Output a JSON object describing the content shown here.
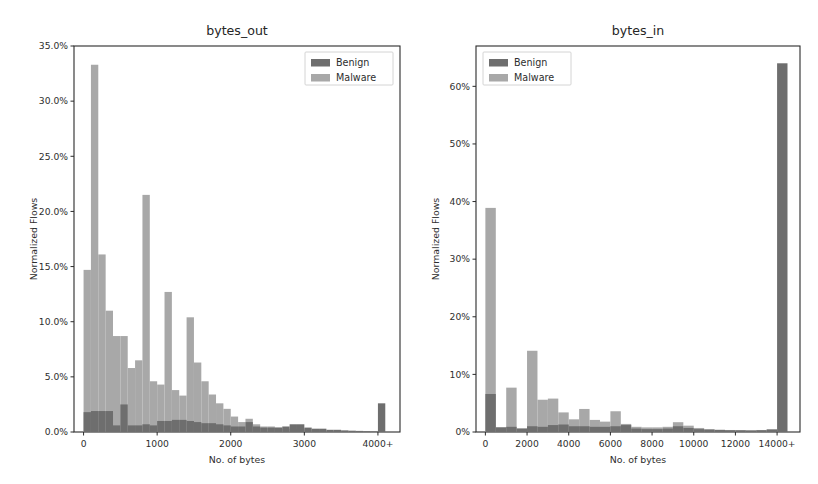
{
  "figure": {
    "background": "#ffffff",
    "width": 818,
    "height": 484
  },
  "colors": {
    "benign": "#6e6e6e",
    "malware": "#a8a8a8",
    "axis": "#2b2b2b",
    "text": "#2e2e2e"
  },
  "legend": {
    "benign_label": "Benign",
    "malware_label": "Malware"
  },
  "chart_data": [
    {
      "type": "bar",
      "id": "bytes_out",
      "title": "bytes_out",
      "xlabel": "No. of bytes",
      "ylabel": "Normalized Flows",
      "grid": false,
      "legend_position": "upper right",
      "xlim": [
        -130,
        4300
      ],
      "ylim": [
        0,
        35
      ],
      "xticks": [
        0,
        1000,
        2000,
        3000,
        4000
      ],
      "xticklabels": [
        "0",
        "1000",
        "2000",
        "3000",
        "4000+"
      ],
      "yticks": [
        0,
        5,
        10,
        15,
        20,
        25,
        30,
        35
      ],
      "yticklabels": [
        "0.0%",
        "5.0%",
        "10.0%",
        "15.0%",
        "20.0%",
        "25.0%",
        "30.0%",
        "35.0%"
      ],
      "bin_width": 100,
      "bin_starts": [
        0,
        100,
        200,
        300,
        400,
        500,
        600,
        700,
        800,
        900,
        1000,
        1100,
        1200,
        1300,
        1400,
        1500,
        1600,
        1700,
        1800,
        1900,
        2000,
        2100,
        2200,
        2300,
        2400,
        2500,
        2600,
        2700,
        2800,
        2900,
        3000,
        3100,
        3200,
        3300,
        3400,
        3500,
        3600,
        3700,
        3800,
        3900,
        4000
      ],
      "series": [
        {
          "name": "Malware",
          "color": "#a8a8a8",
          "values": [
            14.7,
            33.3,
            16.1,
            11.0,
            8.7,
            8.7,
            5.8,
            6.5,
            21.5,
            4.6,
            4.3,
            12.7,
            3.8,
            3.3,
            10.4,
            6.3,
            4.6,
            3.4,
            2.6,
            2.1,
            1.4,
            0.9,
            1.2,
            0.7,
            0.5,
            0.5,
            0.4,
            0.3,
            0.3,
            0.3,
            0.2,
            0.2,
            0.15,
            0.1,
            0.1,
            0.08,
            0.06,
            0.05,
            0.04,
            0.03,
            0.0
          ]
        },
        {
          "name": "Benign",
          "color": "#6e6e6e",
          "values": [
            1.8,
            1.9,
            1.9,
            1.9,
            0.6,
            2.5,
            0.6,
            0.6,
            0.7,
            0.6,
            1.0,
            1.0,
            1.1,
            1.1,
            1.0,
            0.9,
            0.8,
            0.8,
            0.7,
            0.6,
            0.5,
            0.5,
            0.9,
            0.5,
            0.4,
            0.4,
            0.4,
            0.5,
            0.7,
            0.7,
            0.4,
            0.3,
            0.3,
            0.2,
            0.2,
            0.15,
            0.12,
            0.1,
            0.08,
            0.06,
            2.6
          ]
        }
      ]
    },
    {
      "type": "bar",
      "id": "bytes_in",
      "title": "bytes_in",
      "xlabel": "No. of bytes",
      "ylabel": "Normalized Flows",
      "grid": false,
      "legend_position": "upper left",
      "xlim": [
        -450,
        15100
      ],
      "ylim": [
        0,
        67
      ],
      "xticks": [
        0,
        2000,
        4000,
        6000,
        8000,
        10000,
        12000,
        14000
      ],
      "xticklabels": [
        "0",
        "2000",
        "4000",
        "6000",
        "8000",
        "10000",
        "12000",
        "14000+"
      ],
      "yticks": [
        0,
        10,
        20,
        30,
        40,
        50,
        60
      ],
      "yticklabels": [
        "0%",
        "10%",
        "20%",
        "30%",
        "40%",
        "50%",
        "60%"
      ],
      "bin_width": 500,
      "bin_starts": [
        0,
        500,
        1000,
        1500,
        2000,
        2500,
        3000,
        3500,
        4000,
        4500,
        5000,
        5500,
        6000,
        6500,
        7000,
        7500,
        8000,
        8500,
        9000,
        9500,
        10000,
        10500,
        11000,
        11500,
        12000,
        12500,
        13000,
        13500,
        14000
      ],
      "series": [
        {
          "name": "Malware",
          "color": "#a8a8a8",
          "values": [
            38.9,
            0.8,
            7.7,
            0.6,
            14.1,
            5.6,
            5.8,
            3.4,
            2.2,
            4.0,
            2.1,
            1.8,
            3.6,
            1.4,
            0.9,
            0.8,
            0.8,
            0.9,
            1.7,
            1.1,
            0.7,
            0.5,
            0.4,
            0.35,
            0.3,
            0.3,
            0.35,
            0.5,
            0.0
          ]
        },
        {
          "name": "Benign",
          "color": "#6e6e6e",
          "values": [
            6.6,
            0.8,
            0.9,
            0.6,
            1.0,
            0.9,
            1.2,
            1.3,
            1.0,
            1.0,
            0.9,
            0.9,
            1.0,
            1.2,
            0.6,
            0.5,
            0.5,
            0.6,
            1.0,
            0.7,
            0.5,
            0.4,
            0.35,
            0.3,
            0.3,
            0.25,
            0.3,
            0.4,
            64.0
          ]
        }
      ]
    }
  ]
}
